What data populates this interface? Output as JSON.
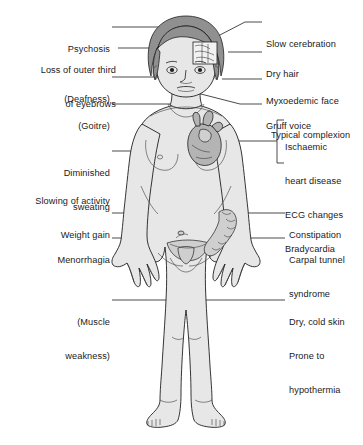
{
  "diagram": {
    "background_color": "#ffffff",
    "body_fill_color": "#e7e7e7",
    "outline_color": "#1f1f1f",
    "organ_fill_color": "#b8b8b8",
    "hair_fill_color": "#8f8f8f"
  },
  "labels_left": [
    {
      "id": "psychosis",
      "text": "Psychosis",
      "lines": [
        "Psychosis"
      ]
    },
    {
      "id": "eyebrows",
      "text": "Loss of outer third of eyebrows",
      "lines": [
        "Loss of outer third",
        "of eyebrows"
      ]
    },
    {
      "id": "deafness",
      "text": "(Deafness)",
      "lines": [
        "(Deafness)"
      ]
    },
    {
      "id": "goitre",
      "text": "(Goitre)",
      "lines": [
        "(Goitre)"
      ]
    },
    {
      "id": "diminished-sweating",
      "text": "Diminished sweating",
      "lines": [
        "Diminished",
        "sweating"
      ]
    },
    {
      "id": "slowing-of-activity",
      "text": "Slowing of activity",
      "lines": [
        "Slowing of activity"
      ]
    },
    {
      "id": "weight-gain",
      "text": "Weight gain",
      "lines": [
        "Weight gain"
      ]
    },
    {
      "id": "menorrhagia",
      "text": "Menorrhagia",
      "lines": [
        "Menorrhagia"
      ]
    },
    {
      "id": "muscle-weakness",
      "text": "(Muscle weakness)",
      "lines": [
        "(Muscle",
        "weakness)"
      ]
    }
  ],
  "labels_right": [
    {
      "id": "slow-cerebration",
      "text": "Slow cerebration",
      "lines": [
        "Slow cerebration"
      ]
    },
    {
      "id": "dry-hair",
      "text": "Dry hair",
      "lines": [
        "Dry hair"
      ]
    },
    {
      "id": "myxoedemic-face",
      "text": "Myxoedemic face Typical complexion",
      "lines": [
        "Myxoedemic face",
        "Typical complexion"
      ]
    },
    {
      "id": "gruff-voice",
      "text": "Gruff voice",
      "lines": [
        "Gruff voice"
      ]
    },
    {
      "id": "cardiac-group",
      "text": "Ischaemic heart disease ECG changes Bradycardia",
      "lines": [
        "Ischaemic",
        "heart disease",
        "ECG changes",
        "Bradycardia"
      ]
    },
    {
      "id": "constipation",
      "text": "Constipation",
      "lines": [
        "Constipation"
      ]
    },
    {
      "id": "carpal-tunnel",
      "text": "Carpal tunnel syndrome",
      "lines": [
        "Carpal tunnel",
        "syndrome"
      ]
    },
    {
      "id": "dry-cold-skin",
      "text": "Dry, cold skin Prone to hypothermia",
      "lines": [
        "Dry, cold skin",
        "Prone to",
        "hypothermia"
      ]
    }
  ],
  "bracket": {
    "id": "cardiac-bracket",
    "shape": "square-bracket-left",
    "groups": [
      "Ischaemic",
      "heart disease",
      "ECG changes",
      "Bradycardia"
    ]
  }
}
